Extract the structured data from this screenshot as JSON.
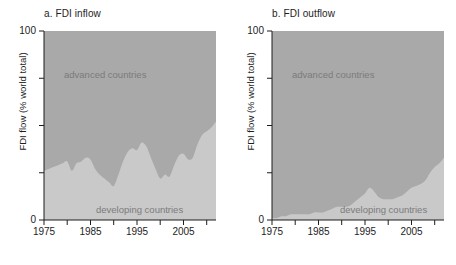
{
  "figure": {
    "background": "#ffffff",
    "panels": [
      {
        "id": "inflow",
        "title": "a. FDI inflow",
        "ylabel": "FDI flow (% world total)",
        "label_advanced": "advanced countries",
        "label_developing": "developing countries"
      },
      {
        "id": "outflow",
        "title": "b. FDI outflow",
        "ylabel": "FDI flow (% world total)",
        "label_advanced": "advanced countries",
        "label_developing": "developing countries"
      }
    ],
    "ytick_top": "100",
    "ytick_bottom": "0",
    "xticks": [
      "1975",
      "1985",
      "1995",
      "2005"
    ]
  },
  "colors": {
    "advanced_fill": "#a9a9a9",
    "developing_fill": "#c9c9c9",
    "axis": "#1d1d1d",
    "in_plot_text": "#7b7b7b",
    "title_text": "#1d1d1d"
  },
  "chart_data": [
    {
      "type": "area",
      "id": "inflow",
      "title": "a. FDI inflow",
      "xlabel": "",
      "ylabel": "FDI flow (% world total)",
      "xlim": [
        1975,
        2012
      ],
      "ylim": [
        0,
        100
      ],
      "grid": false,
      "legend": "in-plot annotations",
      "stacked": true,
      "xticks_major": [
        1975,
        1985,
        1995,
        2005
      ],
      "xticks_minor": [
        1980,
        1990,
        2000,
        2010
      ],
      "yticks": [
        0,
        25,
        50,
        75,
        100
      ],
      "x": [
        1975,
        1976,
        1977,
        1978,
        1979,
        1980,
        1981,
        1982,
        1983,
        1984,
        1985,
        1986,
        1987,
        1988,
        1989,
        1990,
        1991,
        1992,
        1993,
        1994,
        1995,
        1996,
        1997,
        1998,
        1999,
        2000,
        2001,
        2002,
        2003,
        2004,
        2005,
        2006,
        2007,
        2008,
        2009,
        2010,
        2011,
        2012
      ],
      "series": [
        {
          "name": "developing countries",
          "values": [
            26,
            27,
            28,
            29,
            30,
            31,
            26,
            30,
            31,
            33,
            32,
            27,
            24,
            22,
            20,
            18,
            24,
            31,
            36,
            38,
            37,
            41,
            39,
            33,
            27,
            22,
            24,
            23,
            29,
            34,
            35,
            32,
            33,
            40,
            45,
            47,
            49,
            52
          ]
        },
        {
          "name": "advanced countries",
          "values": [
            74,
            73,
            72,
            71,
            70,
            69,
            74,
            70,
            69,
            67,
            68,
            73,
            76,
            78,
            80,
            82,
            76,
            69,
            64,
            62,
            63,
            59,
            61,
            67,
            73,
            78,
            76,
            77,
            71,
            66,
            65,
            68,
            67,
            60,
            55,
            53,
            51,
            48
          ]
        }
      ]
    },
    {
      "type": "area",
      "id": "outflow",
      "title": "b. FDI outflow",
      "xlabel": "",
      "ylabel": "FDI flow (% world total)",
      "xlim": [
        1975,
        2012
      ],
      "ylim": [
        0,
        100
      ],
      "grid": false,
      "legend": "in-plot annotations",
      "stacked": true,
      "xticks_major": [
        1975,
        1985,
        1995,
        2005
      ],
      "xticks_minor": [
        1980,
        1990,
        2000,
        2010
      ],
      "yticks": [
        0,
        25,
        50,
        75,
        100
      ],
      "x": [
        1975,
        1976,
        1977,
        1978,
        1979,
        1980,
        1981,
        1982,
        1983,
        1984,
        1985,
        1986,
        1987,
        1988,
        1989,
        1990,
        1991,
        1992,
        1993,
        1994,
        1995,
        1996,
        1997,
        1998,
        1999,
        2000,
        2001,
        2002,
        2003,
        2004,
        2005,
        2006,
        2007,
        2008,
        2009,
        2010,
        2011,
        2012
      ],
      "series": [
        {
          "name": "developing countries",
          "values": [
            1,
            1,
            2,
            2,
            3,
            3,
            3,
            3,
            3,
            4,
            4,
            4,
            5,
            6,
            7,
            7,
            7,
            8,
            10,
            12,
            14,
            17,
            15,
            12,
            11,
            11,
            11,
            12,
            13,
            15,
            17,
            18,
            19,
            21,
            25,
            28,
            30,
            33
          ]
        },
        {
          "name": "advanced countries",
          "values": [
            99,
            99,
            98,
            98,
            97,
            97,
            97,
            97,
            97,
            96,
            96,
            96,
            95,
            94,
            93,
            93,
            93,
            92,
            90,
            88,
            86,
            83,
            85,
            88,
            89,
            89,
            89,
            88,
            87,
            85,
            83,
            82,
            81,
            79,
            75,
            72,
            70,
            67
          ]
        }
      ]
    }
  ]
}
